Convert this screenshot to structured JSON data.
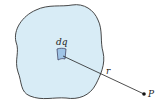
{
  "diagram": {
    "labels": {
      "element": "dq",
      "distance": "r",
      "point": "P"
    },
    "colors": {
      "region_fill": "#d8ecf6",
      "region_stroke": "#333333",
      "element_fill": "#9fc4e6",
      "line": "#222222"
    }
  }
}
